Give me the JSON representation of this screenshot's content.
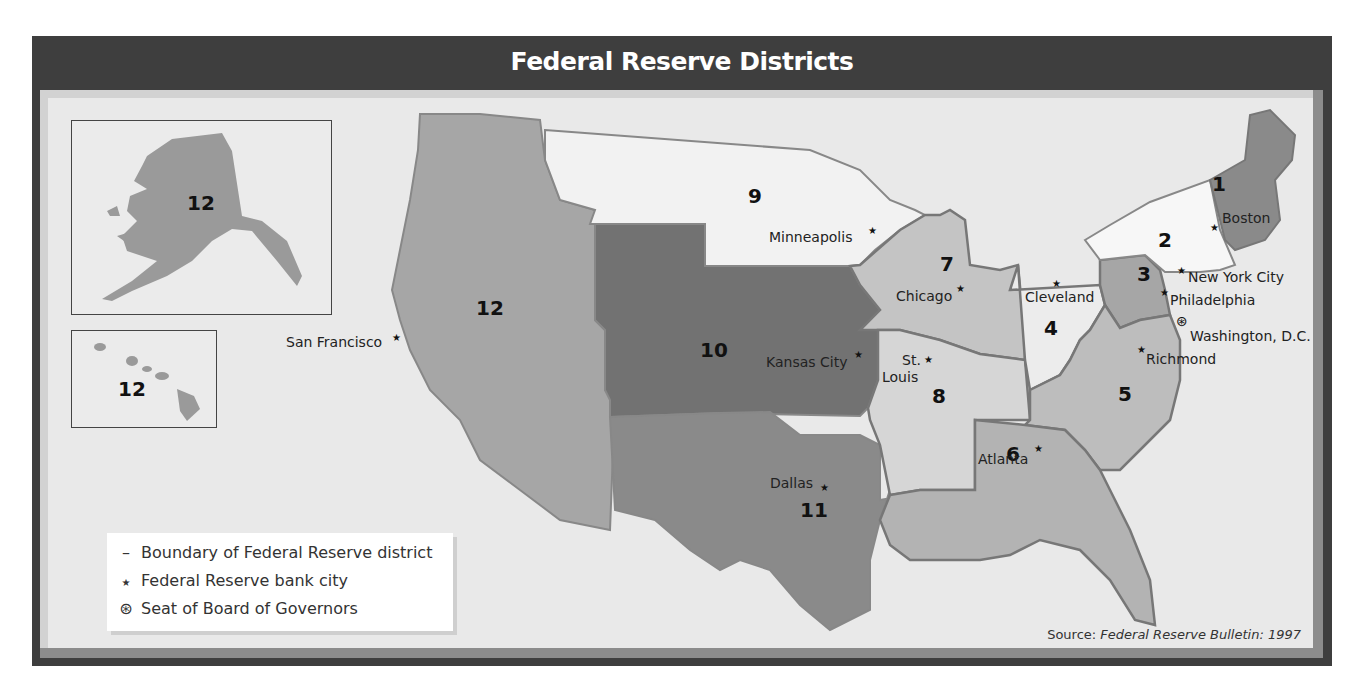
{
  "title": "Federal Reserve Districts",
  "colors": {
    "frame": "#3e3e3e",
    "panel_bg": "#e9e9e9",
    "district_light": "#f4f4f4",
    "district_pale": "#d9d9d9",
    "district_mid": "#bfbfbf",
    "district_medium": "#a6a6a6",
    "district_dark": "#8a8a8a",
    "district_darkest": "#727272"
  },
  "districts": [
    {
      "number": "1",
      "bank_city": "Boston"
    },
    {
      "number": "2",
      "bank_city": "New York City"
    },
    {
      "number": "3",
      "bank_city": "Philadelphia"
    },
    {
      "number": "4",
      "bank_city": "Cleveland"
    },
    {
      "number": "5",
      "bank_city": "Richmond"
    },
    {
      "number": "6",
      "bank_city": "Atlanta"
    },
    {
      "number": "7",
      "bank_city": "Chicago"
    },
    {
      "number": "8",
      "bank_city": "St. Louis"
    },
    {
      "number": "9",
      "bank_city": "Minneapolis"
    },
    {
      "number": "10",
      "bank_city": "Kansas City"
    },
    {
      "number": "11",
      "bank_city": "Dallas"
    },
    {
      "number": "12",
      "bank_city": "San Francisco"
    }
  ],
  "labels": {
    "d1": "1",
    "d2": "2",
    "d3": "3",
    "d4": "4",
    "d5": "5",
    "d6": "6",
    "d7": "7",
    "d8": "8",
    "d9": "9",
    "d10": "10",
    "d11": "11",
    "d12": "12",
    "alaska": "12",
    "hawaii": "12"
  },
  "cities": {
    "boston": "Boston",
    "new_york": "New York City",
    "philadelphia": "Philadelphia",
    "washington": "Washington, D.C.",
    "richmond": "Richmond",
    "cleveland": "Cleveland",
    "chicago": "Chicago",
    "minneapolis": "Minneapolis",
    "kansas_city": "Kansas City",
    "st": "St.",
    "louis": "Louis",
    "dallas": "Dallas",
    "atlanta": "Atlanta",
    "san_francisco": "San Francisco"
  },
  "legend": {
    "items": [
      {
        "symbol": "–",
        "icon": "boundary-line-icon",
        "label": "Boundary of Federal Reserve district"
      },
      {
        "symbol": "★",
        "icon": "star-icon",
        "label": "Federal Reserve bank city"
      },
      {
        "symbol": "⊛",
        "icon": "circled-star-icon",
        "label": "Seat of Board of Governors"
      }
    ]
  },
  "source": {
    "prefix": "Source: ",
    "citation": "Federal Reserve Bulletin: 1997"
  }
}
